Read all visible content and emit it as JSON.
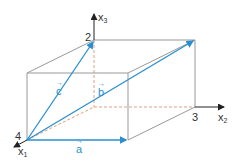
{
  "diagram": {
    "type": "3D coordinate cuboid with vectors",
    "colors": {
      "edges": "#999999",
      "vectors": "#2a8fd0",
      "axes": "#222222",
      "hidden": "#e0a080"
    },
    "axes": [
      {
        "name": "x1",
        "label": "x",
        "sub": "1"
      },
      {
        "name": "x2",
        "label": "x",
        "sub": "2"
      },
      {
        "name": "x3",
        "label": "x",
        "sub": "3"
      }
    ],
    "points": [
      {
        "id": "4",
        "label": "4"
      },
      {
        "id": "3",
        "label": "3"
      },
      {
        "id": "2",
        "label": "2"
      }
    ],
    "vectors": [
      {
        "name": "a",
        "label": "a"
      },
      {
        "name": "b",
        "label": "b"
      },
      {
        "name": "c",
        "label": "c"
      }
    ]
  }
}
